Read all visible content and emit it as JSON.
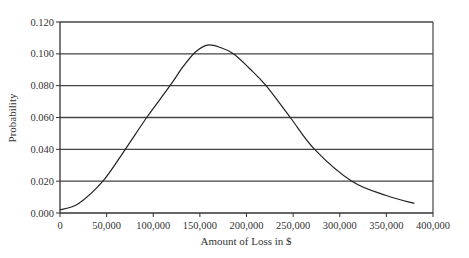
{
  "chart_data": {
    "type": "line",
    "title": "",
    "xlabel": "Amount of Loss in $",
    "ylabel": "Probability",
    "xlim": [
      0,
      400000
    ],
    "ylim": [
      0,
      0.12
    ],
    "grid": {
      "horizontal": true,
      "vertical": false
    },
    "legend": null,
    "x_ticks": [
      "0",
      "50,000",
      "100,000",
      "150,000",
      "200,000",
      "250,000",
      "300,000",
      "350,000",
      "400,000"
    ],
    "y_ticks": [
      "0.000",
      "0.020",
      "0.040",
      "0.060",
      "0.080",
      "0.100",
      "0.120"
    ],
    "series": [
      {
        "name": "Loss distribution",
        "x": [
          0,
          20000,
          46000,
          70000,
          93000,
          118000,
          132000,
          145000,
          158000,
          172000,
          186000,
          203000,
          221000,
          247000,
          273000,
          313000,
          350000,
          380000
        ],
        "y": [
          0.002,
          0.006,
          0.02,
          0.04,
          0.06,
          0.08,
          0.092,
          0.101,
          0.1055,
          0.104,
          0.1,
          0.091,
          0.08,
          0.06,
          0.04,
          0.02,
          0.011,
          0.006
        ]
      }
    ]
  }
}
